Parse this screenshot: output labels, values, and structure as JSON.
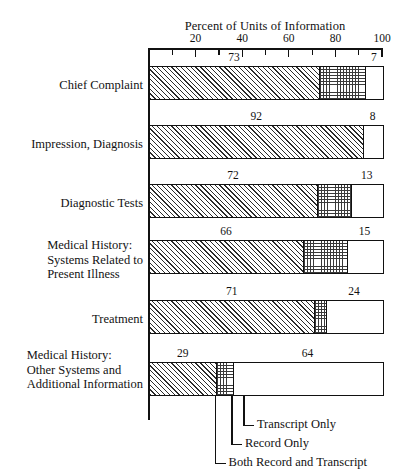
{
  "chart_data": {
    "type": "bar",
    "orientation": "horizontal",
    "stacked": true,
    "title": "Percent of Units of Information",
    "xlabel": "",
    "ylabel": "",
    "xlim": [
      0,
      100
    ],
    "xticks": [
      0,
      10,
      20,
      30,
      40,
      50,
      60,
      70,
      80,
      90,
      100
    ],
    "xtick_labels": [
      "20",
      "40",
      "60",
      "80",
      "100"
    ],
    "xtick_label_values": [
      20,
      40,
      60,
      80,
      100
    ],
    "grid": false,
    "legend_position": "bottom-callouts",
    "categories": [
      "Chief Complaint",
      "Impression, Diagnosis",
      "Diagnostic Tests",
      "Medical History:\nSystems Related to\nPresent Illness",
      "Treatment",
      "Medical History:\nOther Systems and\nAdditional Information"
    ],
    "series": [
      {
        "name": "Both Record and Transcript",
        "pattern": "diagonal-hatch",
        "values": [
          73,
          92,
          72,
          66,
          71,
          29
        ]
      },
      {
        "name": "Record Only",
        "pattern": "dotted-grid",
        "values": [
          20,
          0,
          15,
          19,
          5,
          7
        ]
      },
      {
        "name": "Transcript Only",
        "pattern": "white",
        "values": [
          7,
          8,
          13,
          15,
          24,
          64
        ]
      }
    ],
    "value_labels": {
      "both_record_and_transcript": [
        73,
        92,
        72,
        66,
        71,
        29
      ],
      "transcript_only": [
        7,
        8,
        13,
        15,
        24,
        64
      ]
    },
    "callouts": [
      {
        "label": "Transcript Only"
      },
      {
        "label": "Record Only"
      },
      {
        "label": "Both Record and Transcript"
      }
    ],
    "colors": {
      "line": "#111111",
      "hatch": "#2b2b2b",
      "dots": "#3a3a3a",
      "plain": "#ffffff",
      "background": "#ffffff"
    }
  }
}
